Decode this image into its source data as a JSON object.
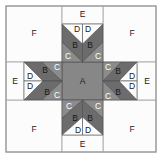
{
  "diagram": {
    "colors": {
      "background": "#ffffff",
      "white_patch": "#fcfcfc",
      "A": "#878787",
      "B": "#6c6c6c",
      "C": "#8c8c8c",
      "outline": "#b0b0b0",
      "seam_dark": "#4a4a4a",
      "label_dark": "#1a1a1a",
      "label_light": "#ffffff"
    },
    "outer": {
      "x": 6,
      "y": 6,
      "w": 150,
      "h": 146
    },
    "pieces": {
      "F": [
        {
          "label": "F",
          "x": 6,
          "y": 6,
          "w": 56,
          "h": 56,
          "lx": 34,
          "ly": 33
        },
        {
          "label": "F",
          "x": 103,
          "y": 6,
          "w": 53,
          "h": 56,
          "lx": 132,
          "ly": 33
        },
        {
          "label": "F",
          "x": 6,
          "y": 100,
          "w": 56,
          "h": 52,
          "lx": 34,
          "ly": 129
        },
        {
          "label": "F",
          "x": 103,
          "y": 100,
          "w": 53,
          "h": 52,
          "lx": 132,
          "ly": 129
        }
      ],
      "E": [
        {
          "label": "E",
          "x": 62,
          "y": 6,
          "w": 41,
          "h": 18,
          "lx": 82.5,
          "ly": 14
        },
        {
          "label": "E",
          "x": 62,
          "y": 135,
          "w": 41,
          "h": 17,
          "lx": 82.5,
          "ly": 144
        },
        {
          "label": "E",
          "x": 6,
          "y": 62,
          "w": 18,
          "h": 38,
          "lx": 15,
          "ly": 81
        },
        {
          "label": "E",
          "x": 137,
          "y": 62,
          "w": 19,
          "h": 38,
          "lx": 147,
          "ly": 81
        }
      ],
      "A": {
        "label": "A",
        "x": 62,
        "y": 62,
        "w": 41,
        "h": 38,
        "lx": 82.5,
        "ly": 81
      }
    },
    "arms": [
      {
        "name": "top",
        "B": [
          "62,24 82.5,44 82.5,62 62,42",
          "103,24 82.5,44 82.5,62 103,42"
        ],
        "C": [
          "62,42 82.5,62 62,62",
          "103,42 82.5,62 103,62"
        ],
        "D": [
          "62,24 82.5,24 82.5,44",
          "103,24 82.5,24 82.5,44"
        ],
        "labels": [
          {
            "t": "D",
            "x": 77,
            "y": 29
          },
          {
            "t": "D",
            "x": 88,
            "y": 29
          },
          {
            "t": "B",
            "x": 75,
            "y": 45
          },
          {
            "t": "B",
            "x": 90,
            "y": 45
          },
          {
            "t": "C",
            "x": 68,
            "y": 56,
            "light": true
          },
          {
            "t": "C",
            "x": 98,
            "y": 56,
            "light": true
          }
        ]
      },
      {
        "name": "bottom",
        "B": [
          "62,135 82.5,117 82.5,100 62,118",
          "103,135 82.5,117 82.5,100 103,118"
        ],
        "C": [
          "62,118 82.5,100 62,100",
          "103,118 82.5,100 103,100"
        ],
        "D": [
          "62,135 82.5,135 82.5,117",
          "103,135 82.5,135 82.5,117"
        ],
        "labels": [
          {
            "t": "D",
            "x": 78,
            "y": 130
          },
          {
            "t": "D",
            "x": 88,
            "y": 130
          },
          {
            "t": "B",
            "x": 75,
            "y": 118
          },
          {
            "t": "B",
            "x": 90,
            "y": 118
          },
          {
            "t": "C",
            "x": 69,
            "y": 106,
            "light": true
          },
          {
            "t": "C",
            "x": 98,
            "y": 106,
            "light": true
          }
        ]
      },
      {
        "name": "left",
        "B": [
          "24,62 43,81 62,81 42,62",
          "24,100 43,81 62,81 42,100"
        ],
        "C": [
          "42,62 62,81 62,62",
          "42,100 62,81 62,100"
        ],
        "D": [
          "24,62 24,81 43,81",
          "24,100 24,81 43,81"
        ],
        "labels": [
          {
            "t": "D",
            "x": 30,
            "y": 76
          },
          {
            "t": "D",
            "x": 30,
            "y": 86
          },
          {
            "t": "B",
            "x": 45,
            "y": 70
          },
          {
            "t": "B",
            "x": 47,
            "y": 92
          },
          {
            "t": "C",
            "x": 57,
            "y": 67,
            "light": true
          },
          {
            "t": "C",
            "x": 57,
            "y": 95,
            "light": true
          }
        ]
      },
      {
        "name": "right",
        "B": [
          "137,62 119,81 103,81 121,62",
          "137,100 119,81 103,81 121,100"
        ],
        "C": [
          "121,62 103,81 103,62",
          "121,100 103,81 103,100"
        ],
        "D": [
          "137,62 137,81 119,81",
          "137,100 137,81 119,81"
        ],
        "labels": [
          {
            "t": "D",
            "x": 132,
            "y": 76
          },
          {
            "t": "D",
            "x": 132,
            "y": 86
          },
          {
            "t": "B",
            "x": 118,
            "y": 71
          },
          {
            "t": "B",
            "x": 118,
            "y": 92
          },
          {
            "t": "C",
            "x": 108,
            "y": 67,
            "light": true
          },
          {
            "t": "C",
            "x": 108,
            "y": 96,
            "light": true
          }
        ]
      }
    ]
  }
}
